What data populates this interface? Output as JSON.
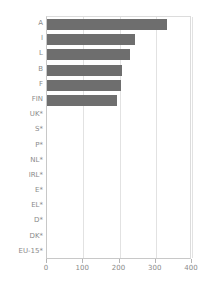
{
  "chart_data": {
    "type": "bar",
    "orientation": "horizontal",
    "title": "",
    "subtitle": "",
    "xlabel": "",
    "ylabel": "",
    "xlim": [
      0,
      400
    ],
    "xticks": [
      0,
      100,
      200,
      300,
      400
    ],
    "xtick_labels": [
      "0",
      "100",
      "200",
      "300",
      "400"
    ],
    "grid": true,
    "grid_axis": "x",
    "legend": false,
    "legend_position": "none",
    "bar_color": "#6e6e6e",
    "categories": [
      "A",
      "I",
      "L",
      "B",
      "F",
      "FIN",
      "UK*",
      "S*",
      "P*",
      "NL*",
      "IRL*",
      "E*",
      "EL*",
      "D*",
      "DK*",
      "EU-15*"
    ],
    "values": [
      332,
      242,
      230,
      208,
      203,
      193,
      0,
      0,
      0,
      0,
      0,
      0,
      0,
      0,
      0,
      0
    ],
    "annotations": [
      "* no data available"
    ]
  },
  "colors": {
    "bar": "#6e6e6e",
    "axis": "#c8c8c8",
    "grid": "#e2e2e2",
    "text": "#8a8a8a",
    "background": "#ffffff"
  }
}
